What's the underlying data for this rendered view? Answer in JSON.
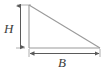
{
  "figure": {
    "name": "right-triangle-dimensions",
    "background_color": "#ffffff",
    "line_color": "#9a9a9a",
    "arrow_color": "#5a5a5a",
    "label_color": "#3c3c3c",
    "labels": {
      "height": "H",
      "base": "B"
    },
    "shape": {
      "type": "right-triangle",
      "vertices": [
        {
          "name": "apex-top-left",
          "x": 29,
          "y": 5
        },
        {
          "name": "right-angle-bottom-left",
          "x": 29,
          "y": 48
        },
        {
          "name": "bottom-right",
          "x": 100,
          "y": 48
        }
      ],
      "edges": [
        {
          "name": "vertical-leg",
          "from": "apex-top-left",
          "to": "right-angle-bottom-left"
        },
        {
          "name": "horizontal-leg",
          "from": "right-angle-bottom-left",
          "to": "bottom-right"
        },
        {
          "name": "hypotenuse",
          "from": "apex-top-left",
          "to": "bottom-right"
        }
      ]
    },
    "dimensions": [
      {
        "name": "height-dimension",
        "label": "H",
        "orientation": "vertical",
        "axis_position_x": 20,
        "from_y": 5,
        "to_y": 48,
        "arrowheads": "both"
      },
      {
        "name": "base-dimension",
        "label": "B",
        "orientation": "horizontal",
        "axis_position_y": 53,
        "from_x": 29,
        "to_x": 100,
        "arrowheads": "both"
      }
    ],
    "extension_lines": [
      {
        "name": "top-extension-line",
        "x1": 17,
        "y1": 5,
        "x2": 31,
        "y2": 5
      },
      {
        "name": "bottom-extension-line",
        "x1": 17,
        "y1": 48,
        "x2": 24,
        "y2": 48
      },
      {
        "name": "left-extension-line",
        "x1": 29,
        "y1": 50,
        "x2": 29,
        "y2": 56
      },
      {
        "name": "right-extension-line",
        "x1": 100,
        "y1": 50,
        "x2": 100,
        "y2": 56
      }
    ]
  }
}
